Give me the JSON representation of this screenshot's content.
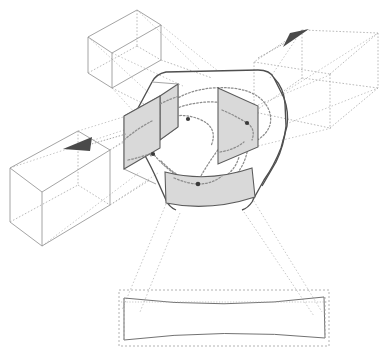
{
  "figure": {
    "background_color": "#ffffff",
    "line_color_solid": "#555555",
    "line_color_light": "#9a9a9a",
    "line_color_dotted": "#8c8c8c",
    "panel_fill": "#d9d9d9",
    "panel_stroke": "#5a5a5a",
    "marker_color": "#3a3a3a",
    "arrow_color": "#4a4a4a",
    "width": 387,
    "height": 358,
    "text_labels": []
  },
  "central_body": {
    "name": "central-junction-body",
    "outline_stroke": "#4f4f4f",
    "outline_width": 1.4,
    "corner_style": "rounded",
    "path": "M 150 92 L 158 79 Q 162 72 172 71 L 262 70 Q 274 70 277 78 L 282 95 L 286 120 Q 287 132 283 140 L 268 170 Q 262 182 256 196 L 252 214 L 174 214 L 166 196 Q 158 180 148 170 L 136 152 Q 130 143 133 134 L 142 110 Z"
  },
  "panels": [
    {
      "name": "panel-left-cross-section",
      "fill": "#d9d9d9",
      "stroke": "#5a5a5a",
      "points": "125,117 160,96 160,148 125,169",
      "has_marker": true,
      "marker_x": 153,
      "marker_y": 154
    },
    {
      "name": "panel-upper-left-cross-section",
      "fill": "#d9d9d9",
      "stroke": "#5a5a5a",
      "points": "160,96 178,84 178,127 160,140",
      "has_marker": false
    },
    {
      "name": "panel-right-cross-section",
      "fill": "#d9d9d9",
      "stroke": "#5a5a5a",
      "points": "218,87 258,105 258,146 218,163",
      "has_marker": true,
      "marker_x": 247,
      "marker_y": 123
    },
    {
      "name": "panel-bottom-cross-section",
      "fill": "#d9d9d9",
      "stroke": "#5a5a5a",
      "points": "165,171 253,167 253,200 165,206",
      "curved": true,
      "path": "M 165 172 Q 208 182 252 168 L 254 197 Q 209 211 165 203 Z",
      "has_marker": true,
      "marker_x": 198,
      "marker_y": 184
    }
  ],
  "dotted_curves": [
    {
      "name": "flow-curve-upper",
      "d": "M 152 120 Q 175 104 205 103 Q 240 102 250 118 Q 258 134 244 142"
    },
    {
      "name": "flow-curve-outer-upper",
      "d": "M 145 131 Q 172 92 212 89 Q 255 87 266 108 Q 275 127 256 140"
    },
    {
      "name": "flow-curve-left-loop",
      "d": "M 150 155 Q 141 139 155 124 Q 174 110 198 118 Q 218 126 210 145"
    },
    {
      "name": "flow-curve-lower-sweep",
      "d": "M 152 153 Q 172 175 198 183 Q 228 191 242 166 Q 252 146 243 124"
    },
    {
      "name": "flow-curve-bottom",
      "d": "M 160 160 Q 186 186 210 182 Q 232 178 238 158"
    }
  ],
  "markers": [
    {
      "name": "node-marker-center",
      "x": 188,
      "y": 119,
      "r": 2.1
    },
    {
      "name": "node-marker-right",
      "x": 247,
      "y": 123,
      "r": 2.1
    },
    {
      "name": "node-marker-left",
      "x": 153,
      "y": 154,
      "r": 2.1
    },
    {
      "name": "node-marker-bottom",
      "x": 198,
      "y": 184,
      "r": 2.1
    }
  ],
  "ducts": [
    {
      "name": "duct-top-left",
      "style": "solid-light",
      "front_face": "88,37 137,10 161,25 112,53",
      "edges": [
        "88,37 88,73",
        "137,10 137,46",
        "161,25 161,60",
        "112,53 112,88",
        "88,73 112,88",
        "112,88 161,60",
        "88,37 112,53",
        "112,53 161,25",
        "137,10 161,25",
        "88,37 137,10"
      ],
      "hidden_edges": [
        "88,73 137,46",
        "137,46 161,60",
        "137,10 137,46"
      ]
    },
    {
      "name": "duct-bottom-left",
      "style": "solid-light",
      "edges": [
        "10,168 78,131",
        "78,131 110,150",
        "10,168 10,222",
        "78,131 78,185",
        "110,150 110,205",
        "10,222 42,246",
        "42,246 110,205",
        "10,168 42,192",
        "42,192 110,150",
        "42,192 42,246"
      ],
      "hidden_edges": [
        "10,222 78,185",
        "78,185 110,205"
      ]
    },
    {
      "name": "duct-right",
      "style": "dotted-light",
      "edges": [
        "302,30 378,33 378,88 302,78",
        "302,78 254,112",
        "378,88 330,128",
        "302,30 254,62",
        "254,62 254,112",
        "254,62 330,74",
        "330,74 378,33",
        "330,74 330,128",
        "254,112 330,128"
      ]
    }
  ],
  "projection_lines": [
    {
      "name": "projection-to-top-left-1",
      "d": "M 112 53 L 180 84"
    },
    {
      "name": "projection-to-top-left-2",
      "d": "M 161 25 L 215 70"
    },
    {
      "name": "projection-to-top-left-3",
      "d": "M 88 37 L 150 93"
    },
    {
      "name": "projection-to-bottom-left-1",
      "d": "M 110 150 L 152 120"
    },
    {
      "name": "projection-to-bottom-left-2",
      "d": "M 110 205 L 155 172"
    },
    {
      "name": "projection-to-bottom-left-3",
      "d": "M 78 131 L 145 110"
    },
    {
      "name": "projection-to-right-1",
      "d": "M 258 105 L 330 74"
    },
    {
      "name": "projection-to-right-2",
      "d": "M 258 146 L 330 128"
    },
    {
      "name": "projection-to-right-3",
      "d": "M 282 95 L 378 33"
    },
    {
      "name": "projection-to-bottom-1",
      "d": "M 168 205 L 124 312"
    },
    {
      "name": "projection-to-bottom-2",
      "d": "M 252 198 L 322 312"
    },
    {
      "name": "projection-to-bottom-3",
      "d": "M 178 212 L 137 313"
    },
    {
      "name": "projection-to-bottom-4",
      "d": "M 246 210 L 318 316"
    }
  ],
  "bottom_projection": {
    "name": "bottom-projected-panel",
    "dashed_rect": {
      "x": 119,
      "y": 290,
      "width": 210,
      "height": 56
    },
    "curved_panel_path": "M 124 298 Q 224 310 324 297 L 325 338 Q 224 328 124 340 Z",
    "dotted_midline": "M 121 302 L 327 302",
    "stroke": "#6a6a6a"
  },
  "arrows": [
    {
      "name": "arrow-flow-left",
      "direction": "left",
      "line": "M 124 135 L 84 146",
      "head_points": "62,148 90,138 88,152"
    },
    {
      "name": "arrow-flow-upper-right",
      "direction": "upper-right",
      "line": "M 262 56 L 288 41",
      "head_points": "308,30 284,46 290,34"
    }
  ]
}
